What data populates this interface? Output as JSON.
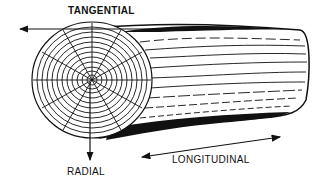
{
  "diagram": {
    "labels": {
      "tangential": "TANGENTIAL",
      "radial": "RADIAL",
      "longitudinal": "LONGITUDINAL"
    },
    "colors": {
      "ink": "#111111",
      "background": "#ffffff"
    }
  }
}
